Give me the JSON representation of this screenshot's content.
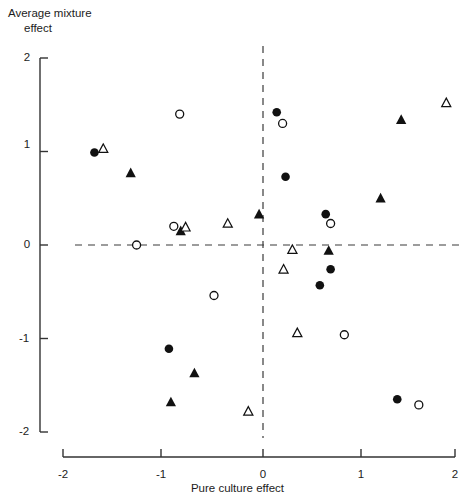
{
  "chart_data": {
    "type": "scatter",
    "title": "",
    "xlabel": "Pure culture effect",
    "ylabel": "Average mixture effect",
    "ylabel_lines": [
      "Average mixture",
      "effect"
    ],
    "xlim": [
      -2,
      2
    ],
    "ylim": [
      -2,
      2
    ],
    "xticks": [
      "-2",
      "-1",
      "0",
      "1",
      "2"
    ],
    "xtick_values": [
      -2,
      -1,
      0,
      1,
      2
    ],
    "yticks": [
      "2",
      "1",
      "0",
      "-1",
      "-2"
    ],
    "ytick_values": [
      2,
      1,
      0,
      -1,
      -2
    ],
    "grid": false,
    "legend": "none",
    "reference_lines": [
      {
        "orientation": "vertical",
        "value": 0,
        "style": "dashed"
      },
      {
        "orientation": "horizontal",
        "value": 0,
        "style": "dashed"
      }
    ],
    "series": [
      {
        "name": "filled-circle",
        "marker": "filled-circle",
        "color": "#111111",
        "points": [
          {
            "x": -1.72,
            "y": 0.99
          },
          {
            "x": 0.14,
            "y": 1.42
          },
          {
            "x": 0.23,
            "y": 0.73
          },
          {
            "x": 0.64,
            "y": 0.33
          },
          {
            "x": 0.69,
            "y": -0.26
          },
          {
            "x": 0.58,
            "y": -0.43
          },
          {
            "x": -0.96,
            "y": -1.11
          },
          {
            "x": 1.37,
            "y": -1.65
          }
        ]
      },
      {
        "name": "open-circle",
        "marker": "open-circle",
        "color": "#111111",
        "points": [
          {
            "x": -0.85,
            "y": 1.4
          },
          {
            "x": 0.2,
            "y": 1.3
          },
          {
            "x": -0.91,
            "y": 0.2
          },
          {
            "x": -1.29,
            "y": 0.0
          },
          {
            "x": 0.69,
            "y": 0.23
          },
          {
            "x": -0.5,
            "y": -0.54
          },
          {
            "x": 0.83,
            "y": -0.96
          },
          {
            "x": 1.59,
            "y": -1.71
          }
        ]
      },
      {
        "name": "filled-triangle",
        "marker": "filled-triangle",
        "color": "#111111",
        "points": [
          {
            "x": -1.35,
            "y": 0.77
          },
          {
            "x": -0.84,
            "y": 0.15
          },
          {
            "x": -0.04,
            "y": 0.33
          },
          {
            "x": 1.41,
            "y": 1.34
          },
          {
            "x": 1.2,
            "y": 0.5
          },
          {
            "x": 0.67,
            "y": -0.06
          },
          {
            "x": -0.7,
            "y": -1.37
          },
          {
            "x": -0.94,
            "y": -1.68
          }
        ]
      },
      {
        "name": "open-triangle",
        "marker": "open-triangle",
        "color": "#111111",
        "points": [
          {
            "x": -1.63,
            "y": 1.03
          },
          {
            "x": -0.79,
            "y": 0.19
          },
          {
            "x": -0.36,
            "y": 0.23
          },
          {
            "x": 1.87,
            "y": 1.52
          },
          {
            "x": 0.3,
            "y": -0.05
          },
          {
            "x": 0.21,
            "y": -0.26
          },
          {
            "x": 0.35,
            "y": -0.94
          },
          {
            "x": -0.15,
            "y": -1.78
          }
        ]
      }
    ]
  }
}
